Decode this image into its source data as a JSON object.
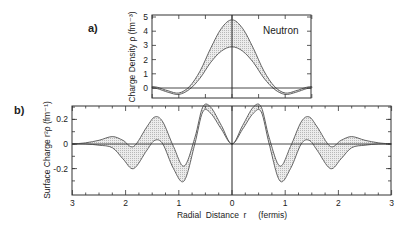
{
  "chart_data": [
    {
      "panel": "a)",
      "type": "area",
      "annotation": "Neutron",
      "ylabel": "Charge Density ρ (fm⁻³)",
      "xlabel": "",
      "xlim": [
        -1.5,
        1.5
      ],
      "ylim": [
        -0.7,
        5
      ],
      "yticks": [
        0,
        1,
        2,
        3,
        4,
        5
      ],
      "grid": false,
      "series": [
        {
          "name": "upper bound",
          "x": [
            0,
            0.2,
            0.4,
            0.6,
            0.8,
            1.0,
            1.2,
            1.4,
            1.5
          ],
          "values": [
            4.8,
            4.2,
            2.8,
            1.2,
            0.1,
            -0.35,
            -0.2,
            0.05,
            0.1
          ]
        },
        {
          "name": "lower bound",
          "x": [
            0,
            0.2,
            0.4,
            0.6,
            0.8,
            1.0,
            1.2,
            1.4,
            1.5
          ],
          "values": [
            2.9,
            2.6,
            1.8,
            0.7,
            -0.1,
            -0.45,
            -0.3,
            -0.05,
            0.0
          ]
        }
      ]
    },
    {
      "panel": "b)",
      "type": "area",
      "ylabel": "Surface Charge r²ρ (fm⁻¹)",
      "xlabel": "Radial Distance r (fermis)",
      "xlim": [
        -3,
        3
      ],
      "ylim": [
        -0.4,
        0.33
      ],
      "xticks": [
        3,
        2,
        1,
        0,
        1,
        2,
        3
      ],
      "yticks": [
        0.2,
        0,
        -0.2
      ],
      "grid": false,
      "series": [
        {
          "name": "upper bound",
          "x": [
            0,
            0.2,
            0.4,
            0.55,
            0.7,
            0.9,
            1.1,
            1.3,
            1.45,
            1.6,
            1.85,
            2.05,
            2.25,
            2.5,
            2.75,
            3.0
          ],
          "values": [
            0,
            0.15,
            0.3,
            0.3,
            0.05,
            -0.18,
            -0.02,
            0.18,
            0.22,
            0.14,
            -0.02,
            0.03,
            0.06,
            0.03,
            0.01,
            0.0
          ],
          "note": "mirror symmetric about r=0"
        },
        {
          "name": "lower bound",
          "x": [
            0,
            0.2,
            0.4,
            0.55,
            0.7,
            0.9,
            1.1,
            1.3,
            1.45,
            1.6,
            1.85,
            2.05,
            2.25,
            2.5,
            2.75,
            3.0
          ],
          "values": [
            0,
            0.12,
            0.25,
            0.26,
            0.0,
            -0.3,
            -0.2,
            0.0,
            0.03,
            -0.05,
            -0.2,
            -0.12,
            -0.03,
            -0.01,
            0.0,
            0.0
          ],
          "note": "mirror symmetric about r=0"
        }
      ]
    }
  ],
  "labels": {
    "panel_a": "a)",
    "panel_b": "b)",
    "neutron": "Neutron",
    "ylabel_a": "Charge Density  ρ  (fm⁻³)",
    "ylabel_b": "Surface  Charge  r²ρ  (fm⁻¹)",
    "xlabel_b": "Radial  Distance  r     (fermis)",
    "yticks_a": [
      "0",
      "1",
      "2",
      "3",
      "4",
      "5"
    ],
    "yticks_b": [
      "0.2",
      "0",
      "-0.2"
    ],
    "xticks_b": [
      "3",
      "2",
      "1",
      "0",
      "1",
      "2",
      "3"
    ]
  }
}
